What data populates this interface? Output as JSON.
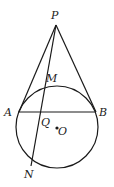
{
  "figure": {
    "labels": {
      "P": "P",
      "M": "M",
      "A": "A",
      "B": "B",
      "Q": "Q",
      "O": "O",
      "N": "N"
    },
    "points": {
      "P": [
        56,
        25
      ],
      "A": [
        19,
        112
      ],
      "B": [
        96,
        112
      ],
      "M": [
        45,
        86
      ],
      "Q": [
        41,
        112
      ],
      "N": [
        31,
        166
      ],
      "O": [
        57,
        128
      ]
    },
    "circle": {
      "center": [
        57,
        127
      ],
      "radius": 41
    },
    "colors": {
      "stroke": "#1a1a1a",
      "text": "#222222"
    }
  }
}
